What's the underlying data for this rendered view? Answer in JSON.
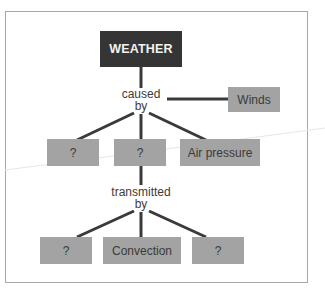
{
  "diagram": {
    "root": {
      "label": "WEATHER"
    },
    "link_1": {
      "label_line1": "caused",
      "label_line2": "by"
    },
    "level_1": [
      {
        "label": "?"
      },
      {
        "label": "?"
      },
      {
        "label": "Air pressure"
      }
    ],
    "side_node": {
      "label": "Winds"
    },
    "link_2": {
      "label_line1": "transmitted",
      "label_line2": "by"
    },
    "level_2": [
      {
        "label": "?"
      },
      {
        "label": "Convection"
      },
      {
        "label": "?"
      }
    ],
    "colors": {
      "root_fill": "#353535",
      "node_fill": "#a3a3a3",
      "connector": "#3a3a3a",
      "frame_border": "#a8a8a8"
    }
  }
}
